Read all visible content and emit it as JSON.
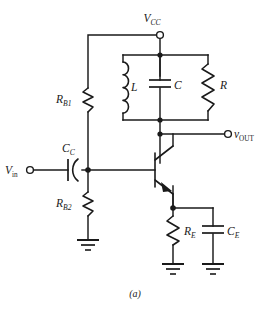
{
  "figure": {
    "caption": "(a)"
  },
  "terminals": [
    {
      "id": "vcc",
      "label": "V",
      "subscript": "CC",
      "name": "supply-terminal"
    },
    {
      "id": "vin",
      "label": "V",
      "subscript": "in",
      "name": "input-terminal"
    },
    {
      "id": "vout",
      "label": "v",
      "subscript": "OUT",
      "name": "output-terminal"
    }
  ],
  "components": {
    "rb1": {
      "label": "R",
      "subscript": "B1",
      "type": "resistor"
    },
    "rb2": {
      "label": "R",
      "subscript": "B2",
      "type": "resistor"
    },
    "re": {
      "label": "R",
      "subscript": "E",
      "type": "resistor"
    },
    "r": {
      "label": "R",
      "subscript": "",
      "type": "resistor"
    },
    "l": {
      "label": "L",
      "subscript": "",
      "type": "inductor"
    },
    "c": {
      "label": "C",
      "subscript": "",
      "type": "capacitor"
    },
    "cc": {
      "label": "C",
      "subscript": "C",
      "type": "capacitor"
    },
    "ce": {
      "label": "C",
      "subscript": "E",
      "type": "capacitor"
    },
    "q1": {
      "label": "",
      "subscript": "",
      "type": "npn-transistor"
    }
  },
  "colors": {
    "ink": "#1a1a1a",
    "background": "#ffffff"
  }
}
